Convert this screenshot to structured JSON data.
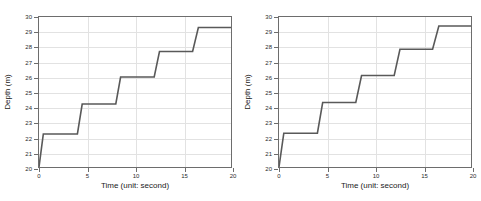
{
  "figure": {
    "background": "#ffffff",
    "panel_count": 2
  },
  "chart_data": [
    {
      "type": "line",
      "title": "",
      "xlabel": "Time  (unit: second)",
      "ylabel": "Depth (m)",
      "xlim": [
        0,
        20
      ],
      "ylim": [
        20,
        30
      ],
      "xticks": [
        0,
        5,
        10,
        15,
        20
      ],
      "yticks": [
        20,
        21,
        22,
        23,
        24,
        25,
        26,
        27,
        28,
        29,
        30
      ],
      "xticklabels": [
        "0",
        "5",
        "10",
        "15",
        "20"
      ],
      "yticklabels": [
        "20",
        "21",
        "22",
        "23",
        "24",
        "25",
        "26",
        "27",
        "28",
        "29",
        "30"
      ],
      "grid": true,
      "legend": "none",
      "line_color": "#595959",
      "line_width": 1.6,
      "series": [
        {
          "name": "depth-staircase",
          "x": [
            0.0,
            0.45,
            4.0,
            4.5,
            8.0,
            8.5,
            12.0,
            12.55,
            16.0,
            16.6,
            20.0
          ],
          "y": [
            20.0,
            22.2,
            22.2,
            24.2,
            24.2,
            26.0,
            26.0,
            27.7,
            27.7,
            29.3,
            29.3
          ]
        }
      ],
      "plateaus": [
        22.2,
        24.2,
        26.0,
        27.7,
        29.3
      ],
      "step_times": [
        0.45,
        4.5,
        8.5,
        12.55,
        16.6
      ]
    },
    {
      "type": "line",
      "title": "",
      "xlabel": "Time  (unit: second)",
      "ylabel": "Depth (m)",
      "xlim": [
        0,
        20
      ],
      "ylim": [
        20,
        30
      ],
      "xticks": [
        0,
        5,
        10,
        15,
        20
      ],
      "yticks": [
        20,
        21,
        22,
        23,
        24,
        25,
        26,
        27,
        28,
        29,
        30
      ],
      "xticklabels": [
        "0",
        "5",
        "10",
        "15",
        "20"
      ],
      "yticklabels": [
        "20",
        "21",
        "22",
        "23",
        "24",
        "25",
        "26",
        "27",
        "28",
        "29",
        "30"
      ],
      "grid": true,
      "legend": "none",
      "line_color": "#595959",
      "line_width": 1.6,
      "series": [
        {
          "name": "depth-staircase",
          "x": [
            0.0,
            0.5,
            4.0,
            4.55,
            8.0,
            8.6,
            12.0,
            12.6,
            16.0,
            16.65,
            20.0
          ],
          "y": [
            20.0,
            22.25,
            22.25,
            24.3,
            24.3,
            26.1,
            26.1,
            27.85,
            27.85,
            29.4,
            29.4
          ]
        }
      ],
      "plateaus": [
        22.25,
        24.3,
        26.1,
        27.85,
        29.4
      ],
      "step_times": [
        0.5,
        4.55,
        8.6,
        12.6,
        16.65
      ]
    }
  ]
}
